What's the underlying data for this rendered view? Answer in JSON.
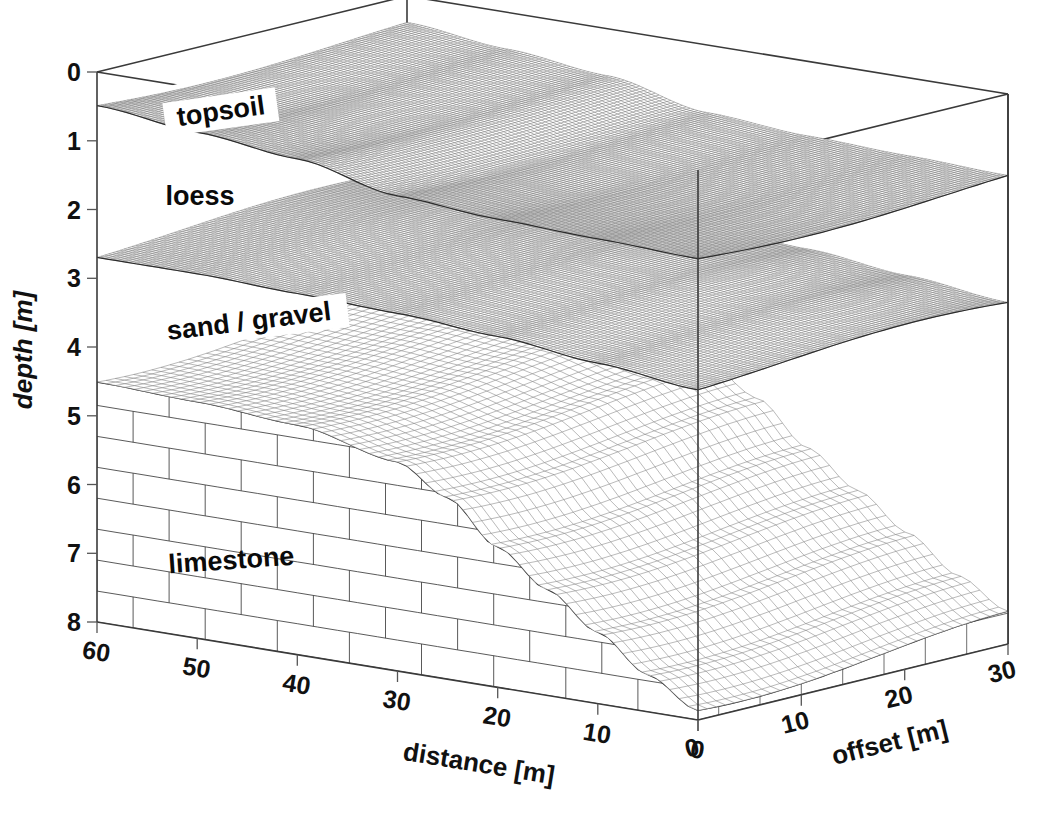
{
  "figure": {
    "kind": "3d-block-diagram",
    "title": "",
    "background_color": "#ffffff",
    "line_color": "#3a3a3a"
  },
  "axes": {
    "depth": {
      "title": "depth [m]",
      "unit": "m",
      "ticks": [
        "0",
        "1",
        "2",
        "3",
        "4",
        "5",
        "6",
        "7",
        "8"
      ],
      "range": [
        0,
        8
      ],
      "orientation": "vertical-left",
      "rotated": true
    },
    "distance": {
      "title": "distance [m]",
      "unit": "m",
      "ticks": [
        "60",
        "50",
        "40",
        "30",
        "20",
        "10",
        "0"
      ],
      "range": [
        60,
        0
      ],
      "direction": "descending-left-to-right",
      "orientation": "bottom-left-oblique"
    },
    "offset": {
      "title": "offset [m]",
      "unit": "m",
      "ticks": [
        "0",
        "10",
        "20",
        "30"
      ],
      "range": [
        0,
        30
      ],
      "orientation": "bottom-right-oblique"
    }
  },
  "layers": [
    {
      "id": "topsoil",
      "label": "topsoil",
      "fill_style": "fine-mesh",
      "label_has_white_box": true,
      "top_depth_m": 0.0,
      "base_depth_m": 1.2,
      "label_rotation_deg": -8
    },
    {
      "id": "loess",
      "label": "loess",
      "fill_style": "blank",
      "label_has_white_box": false,
      "top_depth_m": 1.2,
      "base_depth_m": 2.65,
      "label_rotation_deg": 0
    },
    {
      "id": "sand-gravel",
      "label": "sand / gravel",
      "fill_style": "fine-mesh",
      "label_has_white_box": true,
      "top_depth_m": 2.65,
      "base_depth_m": 4.4,
      "label_rotation_deg": -7
    },
    {
      "id": "limestone",
      "label": "limestone",
      "fill_style": "brick",
      "label_has_white_box": false,
      "top_depth_m": 4.4,
      "base_depth_m": 8.0,
      "label_rotation_deg": -4
    }
  ],
  "chart_data": {
    "type": "surface",
    "title": "",
    "xlabel": "distance [m]",
    "ylabel": "offset [m]",
    "zlabel": "depth [m]",
    "xlim": [
      0,
      60
    ],
    "ylim": [
      0,
      30
    ],
    "zlim": [
      0,
      8
    ],
    "grid": false,
    "legend": "none",
    "surfaces": [
      {
        "name": "topsoil base",
        "style": "fine-mesh",
        "depth_profile_m": [
          {
            "distance": 60,
            "depth": 0.45
          },
          {
            "distance": 50,
            "depth": 0.6
          },
          {
            "distance": 40,
            "depth": 0.75
          },
          {
            "distance": 30,
            "depth": 1.05
          },
          {
            "distance": 20,
            "depth": 1.15
          },
          {
            "distance": 10,
            "depth": 1.2
          },
          {
            "distance": 0,
            "depth": 1.25
          }
        ]
      },
      {
        "name": "loess base",
        "style": "fine-mesh",
        "depth_profile_m": [
          {
            "distance": 60,
            "depth": 2.6
          },
          {
            "distance": 50,
            "depth": 2.6
          },
          {
            "distance": 40,
            "depth": 2.65
          },
          {
            "distance": 30,
            "depth": 2.7
          },
          {
            "distance": 20,
            "depth": 2.8
          },
          {
            "distance": 10,
            "depth": 2.95
          },
          {
            "distance": 0,
            "depth": 3.1
          }
        ]
      },
      {
        "name": "sand / gravel base (limestone top)",
        "style": "coarse-mesh",
        "depth_profile_m": [
          {
            "distance": 60,
            "depth": 4.35
          },
          {
            "distance": 50,
            "depth": 4.4
          },
          {
            "distance": 40,
            "depth": 4.5
          },
          {
            "distance": 30,
            "depth": 4.8
          },
          {
            "distance": 25,
            "depth": 5.2
          },
          {
            "distance": 20,
            "depth": 5.8
          },
          {
            "distance": 15,
            "depth": 6.3
          },
          {
            "distance": 10,
            "depth": 6.8
          },
          {
            "distance": 5,
            "depth": 7.3
          },
          {
            "distance": 0,
            "depth": 7.7
          }
        ]
      }
    ],
    "annotations": [
      "topsoil",
      "loess",
      "sand / gravel",
      "limestone"
    ]
  }
}
